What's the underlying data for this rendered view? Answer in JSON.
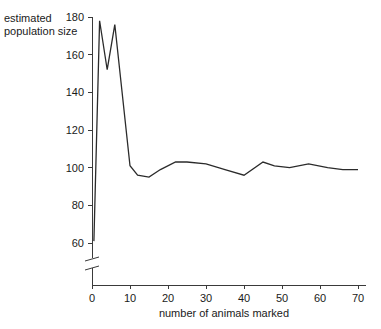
{
  "chart_data": {
    "type": "line",
    "title": "",
    "xlabel": "number of animals marked",
    "ylabel": "estimated population size",
    "ylabel_lines": [
      "estimated",
      "population size"
    ],
    "xlim": [
      0,
      72
    ],
    "ylim": [
      58,
      182
    ],
    "y_axis_break": true,
    "y_axis_break_note": "axis broken below 60",
    "grid": false,
    "legend": false,
    "xticks": [
      0,
      10,
      20,
      30,
      40,
      50,
      60,
      70
    ],
    "xtick_labels": [
      "0",
      "10",
      "20",
      "30",
      "40",
      "50",
      "60",
      "70"
    ],
    "yticks": [
      60,
      80,
      100,
      120,
      140,
      160,
      180
    ],
    "ytick_labels": [
      "60",
      "80",
      "100",
      "120",
      "140",
      "160",
      "180"
    ],
    "series": [
      {
        "name": "estimated population size",
        "color": "#2b2b2b",
        "x": [
          0.5,
          2,
          4,
          6,
          10,
          12,
          15,
          18,
          22,
          25,
          30,
          35,
          40,
          45,
          48,
          52,
          57,
          62,
          66,
          70
        ],
        "y": [
          61,
          178,
          152,
          176,
          101,
          96,
          95,
          99,
          103,
          103,
          102,
          99,
          96,
          103,
          101,
          100,
          102,
          100,
          99,
          99
        ]
      }
    ]
  },
  "axis": {
    "x_title": "number of animals marked",
    "y_title_line1": "estimated",
    "y_title_line2": "population size"
  }
}
